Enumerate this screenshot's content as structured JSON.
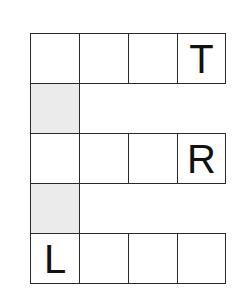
{
  "puzzle": {
    "type": "word-grid",
    "cell_size_px": 49,
    "rows": [
      {
        "row": 0,
        "cells": [
          {
            "col": 0,
            "letter": "",
            "shaded": false
          },
          {
            "col": 1,
            "letter": "",
            "shaded": false
          },
          {
            "col": 2,
            "letter": "",
            "shaded": false
          },
          {
            "col": 3,
            "letter": "T",
            "shaded": false
          }
        ]
      },
      {
        "row": 1,
        "cells": [
          {
            "col": 0,
            "letter": "",
            "shaded": true
          }
        ]
      },
      {
        "row": 2,
        "cells": [
          {
            "col": 0,
            "letter": "",
            "shaded": false
          },
          {
            "col": 1,
            "letter": "",
            "shaded": false
          },
          {
            "col": 2,
            "letter": "",
            "shaded": false
          },
          {
            "col": 3,
            "letter": "R",
            "shaded": false
          }
        ]
      },
      {
        "row": 3,
        "cells": [
          {
            "col": 0,
            "letter": "",
            "shaded": true
          }
        ]
      },
      {
        "row": 4,
        "cells": [
          {
            "col": 0,
            "letter": "L",
            "shaded": false
          },
          {
            "col": 1,
            "letter": "",
            "shaded": false
          },
          {
            "col": 2,
            "letter": "",
            "shaded": false
          },
          {
            "col": 3,
            "letter": "",
            "shaded": false
          }
        ]
      }
    ],
    "colors": {
      "border": "#2a2a2a",
      "shaded_fill": "#ebebeb",
      "letter": "#111111"
    }
  }
}
